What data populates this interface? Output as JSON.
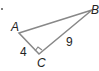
{
  "figure": {
    "type": "right-triangle",
    "vertices": [
      {
        "name": "A",
        "x": 19,
        "y": 33
      },
      {
        "name": "B",
        "x": 92,
        "y": 10
      },
      {
        "name": "C",
        "x": 39,
        "y": 54
      }
    ],
    "right_angle_at": "C",
    "side_labels": {
      "AC": "4",
      "CB": "9"
    },
    "labels": {
      "A": "A",
      "B": "B",
      "C": "C",
      "AC": "4",
      "CB": "9"
    },
    "stroke_color": "#888888",
    "text_color": "#222222"
  }
}
